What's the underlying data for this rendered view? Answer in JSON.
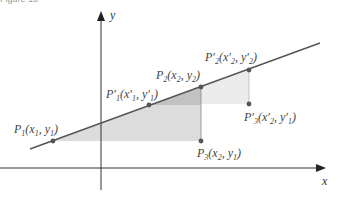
{
  "figure": {
    "caption": "Figure 18"
  },
  "axes": {
    "x_label": "x",
    "y_label": "y"
  },
  "points": [
    {
      "id": "P1",
      "name": "P",
      "sub": "1",
      "coords": "(x",
      "label": "P1(x1, y1)",
      "px": 53,
      "py": 141
    },
    {
      "id": "P1p",
      "label": "P'1(x'1, y'1)",
      "px": 149,
      "py": 105
    },
    {
      "id": "P2",
      "label": "P2(x2, y2)",
      "px": 201,
      "py": 87
    },
    {
      "id": "P2p",
      "label": "P'2(x'2, y'2)",
      "px": 249,
      "py": 70
    },
    {
      "id": "P3",
      "label": "P3(x2, y1)",
      "px": 201,
      "py": 141
    },
    {
      "id": "P3p",
      "label": "P'3(x'2, y'1)",
      "px": 249,
      "py": 104
    }
  ],
  "colors": {
    "line": "#555555",
    "point": "#555555",
    "shade_large": "#d9d9d9",
    "shade_small": "#c4c4c4",
    "shade_right": "#ececec",
    "axis": "#333333"
  }
}
